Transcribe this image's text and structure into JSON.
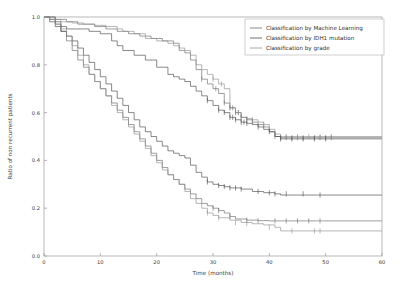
{
  "chart_data": {
    "type": "line",
    "subtype": "kaplan-meier-step",
    "title": "",
    "xlabel": "Time (months)",
    "ylabel": "Ratio of non recurrent patients",
    "xlim": [
      0,
      60
    ],
    "ylim": [
      0.0,
      1.0
    ],
    "xticks": [
      0,
      10,
      20,
      30,
      40,
      50,
      60
    ],
    "xtick_labels": [
      "0",
      "10",
      "20",
      "30",
      "40",
      "50",
      "60"
    ],
    "yticks": [
      0.0,
      0.2,
      0.4,
      0.6,
      0.8,
      1.0
    ],
    "ytick_labels": [
      "0.0",
      "0.2",
      "0.4",
      "0.6",
      "0.8",
      "1.0"
    ],
    "grid": false,
    "legend_position": "upper right",
    "legend": [
      "Classification by Machine Learning",
      "Classification by IDH1 mutation",
      "Classification by grade"
    ],
    "colors": {
      "machine_learning": "#6b6b6b",
      "idh1_mutation": "#4a4a4a",
      "grade": "#8f8f8f",
      "frame": "#9a9a9a",
      "text": "#3a3a3a",
      "background": "#ffffff"
    },
    "series": [
      {
        "name": "Classification by Machine Learning",
        "group": "favorable",
        "color_key": "machine_learning",
        "x": [
          0,
          1,
          2,
          4,
          6,
          9,
          11,
          13,
          15,
          17,
          19,
          21,
          23,
          24,
          25,
          26,
          27,
          28,
          29,
          30,
          31,
          32,
          33,
          34,
          35,
          36,
          37,
          38,
          39,
          40,
          41,
          42,
          60
        ],
        "y": [
          1.0,
          1.0,
          0.99,
          0.98,
          0.97,
          0.96,
          0.95,
          0.94,
          0.93,
          0.92,
          0.91,
          0.9,
          0.89,
          0.86,
          0.85,
          0.82,
          0.78,
          0.74,
          0.72,
          0.7,
          0.68,
          0.64,
          0.62,
          0.6,
          0.58,
          0.57,
          0.56,
          0.55,
          0.54,
          0.52,
          0.5,
          0.495,
          0.495
        ],
        "censor_x": [
          28,
          30.5,
          32,
          33,
          33.5,
          34,
          34.5,
          35,
          36,
          37,
          41,
          42,
          43,
          44,
          45,
          46,
          48,
          49,
          50,
          51
        ],
        "censor_y": [
          0.74,
          0.7,
          0.64,
          0.62,
          0.62,
          0.6,
          0.6,
          0.58,
          0.57,
          0.56,
          0.5,
          0.495,
          0.495,
          0.495,
          0.495,
          0.495,
          0.495,
          0.495,
          0.495,
          0.495
        ]
      },
      {
        "name": "Classification by Machine Learning",
        "group": "unfavorable",
        "color_key": "machine_learning",
        "x": [
          0,
          1,
          2,
          3,
          4,
          5,
          6,
          7,
          8,
          9,
          10,
          11,
          12,
          13,
          14,
          15,
          16,
          17,
          18,
          19,
          20,
          21,
          22,
          23,
          24,
          25,
          26,
          27,
          28,
          29,
          30,
          31,
          32,
          33,
          34,
          36,
          38,
          40,
          42,
          60
        ],
        "y": [
          1.0,
          0.99,
          0.97,
          0.94,
          0.9,
          0.86,
          0.82,
          0.79,
          0.76,
          0.73,
          0.7,
          0.67,
          0.64,
          0.61,
          0.58,
          0.55,
          0.52,
          0.49,
          0.46,
          0.43,
          0.4,
          0.37,
          0.34,
          0.32,
          0.3,
          0.28,
          0.26,
          0.24,
          0.22,
          0.21,
          0.2,
          0.19,
          0.18,
          0.165,
          0.155,
          0.15,
          0.148,
          0.147,
          0.147,
          0.147
        ],
        "censor_x": [
          30,
          31,
          33,
          36,
          38,
          41,
          43,
          45,
          47,
          49
        ],
        "censor_y": [
          0.2,
          0.19,
          0.165,
          0.15,
          0.148,
          0.147,
          0.147,
          0.147,
          0.147,
          0.147
        ]
      },
      {
        "name": "Classification by IDH1 mutation",
        "group": "mutated",
        "color_key": "idh1_mutation",
        "x": [
          0,
          2,
          3,
          4,
          6,
          8,
          10,
          12,
          13,
          14,
          16,
          18,
          20,
          22,
          23,
          24,
          25,
          26,
          27,
          28,
          29,
          30,
          31,
          32,
          33,
          34,
          35,
          36,
          37,
          38,
          39,
          40,
          41,
          42,
          60
        ],
        "y": [
          1.0,
          0.98,
          0.96,
          0.95,
          0.95,
          0.94,
          0.93,
          0.9,
          0.88,
          0.86,
          0.84,
          0.82,
          0.79,
          0.76,
          0.75,
          0.74,
          0.73,
          0.71,
          0.69,
          0.67,
          0.65,
          0.63,
          0.61,
          0.6,
          0.58,
          0.57,
          0.56,
          0.555,
          0.55,
          0.54,
          0.53,
          0.52,
          0.5,
          0.49,
          0.49
        ],
        "censor_x": [
          29,
          31,
          32,
          33,
          33.5,
          34,
          35,
          35.5,
          36,
          38,
          40,
          42,
          44,
          46,
          48,
          50
        ],
        "censor_y": [
          0.65,
          0.61,
          0.6,
          0.58,
          0.58,
          0.57,
          0.56,
          0.56,
          0.555,
          0.54,
          0.52,
          0.49,
          0.49,
          0.49,
          0.49,
          0.49
        ]
      },
      {
        "name": "Classification by IDH1 mutation",
        "group": "wildtype",
        "color_key": "idh1_mutation",
        "x": [
          0,
          1,
          2,
          3,
          4,
          5,
          6,
          7,
          8,
          9,
          10,
          11,
          12,
          13,
          14,
          15,
          16,
          17,
          18,
          19,
          20,
          21,
          22,
          23,
          24,
          25,
          26,
          27,
          28,
          29,
          30,
          31,
          32,
          33,
          35,
          37,
          39,
          41,
          42,
          60
        ],
        "y": [
          1.0,
          0.98,
          0.96,
          0.94,
          0.92,
          0.9,
          0.87,
          0.84,
          0.81,
          0.78,
          0.75,
          0.72,
          0.69,
          0.66,
          0.63,
          0.6,
          0.57,
          0.54,
          0.52,
          0.5,
          0.48,
          0.46,
          0.44,
          0.43,
          0.42,
          0.41,
          0.38,
          0.35,
          0.33,
          0.31,
          0.3,
          0.295,
          0.29,
          0.285,
          0.28,
          0.27,
          0.265,
          0.26,
          0.255,
          0.255
        ],
        "censor_x": [
          29,
          31,
          32,
          33,
          34,
          35,
          38,
          40,
          41,
          43,
          46,
          49
        ],
        "censor_y": [
          0.31,
          0.295,
          0.29,
          0.285,
          0.285,
          0.28,
          0.27,
          0.265,
          0.26,
          0.26,
          0.26,
          0.255
        ]
      },
      {
        "name": "Classification by grade",
        "group": "low-grade",
        "color_key": "grade",
        "x": [
          0,
          1,
          3,
          5,
          7,
          9,
          11,
          13,
          14,
          16,
          18,
          20,
          22,
          23,
          24,
          25,
          26,
          27,
          28,
          29,
          30,
          31,
          32,
          33,
          34,
          35,
          36,
          37,
          38,
          39,
          40,
          41,
          42,
          60
        ],
        "y": [
          1.0,
          0.99,
          0.98,
          0.975,
          0.97,
          0.965,
          0.96,
          0.95,
          0.94,
          0.93,
          0.91,
          0.9,
          0.89,
          0.88,
          0.87,
          0.86,
          0.84,
          0.8,
          0.78,
          0.76,
          0.74,
          0.72,
          0.7,
          0.62,
          0.6,
          0.58,
          0.575,
          0.57,
          0.56,
          0.55,
          0.53,
          0.51,
          0.5,
          0.5
        ],
        "censor_x": [
          30,
          31.5,
          33,
          34,
          34.5,
          35,
          36,
          37,
          39,
          41,
          43,
          45,
          47,
          49,
          51
        ],
        "censor_y": [
          0.74,
          0.72,
          0.62,
          0.6,
          0.6,
          0.58,
          0.575,
          0.57,
          0.55,
          0.51,
          0.5,
          0.5,
          0.5,
          0.5,
          0.5
        ]
      },
      {
        "name": "Classification by grade",
        "group": "high-grade",
        "color_key": "grade",
        "x": [
          0,
          1,
          2,
          3,
          4,
          5,
          6,
          7,
          8,
          9,
          10,
          11,
          12,
          13,
          14,
          15,
          16,
          17,
          18,
          19,
          20,
          21,
          22,
          23,
          24,
          25,
          26,
          27,
          28,
          29,
          30,
          31,
          33,
          35,
          37,
          39,
          41,
          42,
          60
        ],
        "y": [
          1.0,
          0.99,
          0.97,
          0.95,
          0.92,
          0.88,
          0.84,
          0.8,
          0.76,
          0.73,
          0.7,
          0.67,
          0.63,
          0.6,
          0.57,
          0.54,
          0.51,
          0.48,
          0.45,
          0.42,
          0.39,
          0.36,
          0.34,
          0.32,
          0.3,
          0.27,
          0.24,
          0.22,
          0.2,
          0.18,
          0.17,
          0.16,
          0.15,
          0.14,
          0.135,
          0.13,
          0.12,
          0.105,
          0.105
        ],
        "censor_x": [
          29,
          31,
          34,
          36,
          40,
          44,
          48,
          49
        ],
        "censor_y": [
          0.18,
          0.16,
          0.14,
          0.135,
          0.12,
          0.105,
          0.105,
          0.105
        ]
      }
    ]
  }
}
